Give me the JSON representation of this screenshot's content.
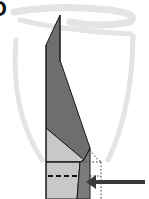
{
  "diagram": {
    "step_label": "D",
    "type": "origami-fold-step",
    "colors": {
      "background": "#ffffff",
      "watermark": "#e4e4e4",
      "paper_dark": "#6e6e6e",
      "paper_mid": "#8a8a8a",
      "paper_light": "#c8c8c8",
      "outline": "#1a1a1a",
      "arrow": "#3a3a3a"
    },
    "elements": {
      "watermark": "faint shield/spider logo",
      "strip": "folded paper strip with diagonal crease",
      "fold_line": "dashed horizontal valley fold line",
      "guide_line": "dotted vertical guide line",
      "arrow": "push-in arrow pointing left"
    }
  }
}
